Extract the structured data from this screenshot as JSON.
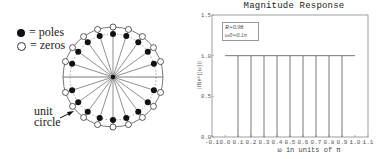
{
  "pole_zero": {
    "legend": [
      {
        "symbol": "filled-dot",
        "label": "=  poles"
      },
      {
        "symbol": "open-circle",
        "label": "=  zeros"
      }
    ],
    "annotation": {
      "line1": "unit",
      "line2": "circle"
    },
    "pole_radius": 0.98,
    "pole_angles_pi": [
      0.1,
      0.2,
      0.3,
      0.4,
      0.5,
      0.6,
      0.7,
      0.8,
      0.9,
      -0.1,
      -0.2,
      -0.3,
      -0.4,
      -0.5,
      -0.6,
      -0.7,
      -0.8,
      -0.9
    ],
    "zero_angles_pi": [
      0.1,
      0.2,
      0.3,
      0.4,
      0.5,
      0.6,
      0.7,
      0.8,
      0.9,
      -0.1,
      -0.2,
      -0.3,
      -0.4,
      -0.5,
      -0.6,
      -0.7,
      -0.8,
      -0.9
    ]
  },
  "chart_data": {
    "type": "line",
    "title": "Magnitude Response",
    "xlabel": "ω in units of π",
    "ylabel": "|H(e^{jω})|",
    "xlim": [
      -0.1,
      1.1
    ],
    "ylim": [
      0,
      1.5
    ],
    "xticks": [
      "-0.1",
      "0.0",
      "0.1",
      "0.2",
      "0.3",
      "0.4",
      "0.5",
      "0.6",
      "0.7",
      "0.8",
      "0.9",
      "1.0",
      "1.1"
    ],
    "yticks": [
      "0.0",
      "0.5",
      "1.0",
      "1.5"
    ],
    "legend_box": {
      "line1": "R=0.98",
      "line2": "ω0=0.1π"
    },
    "series": [
      {
        "name": "magnitude",
        "x": [
          0.0,
          1.0
        ],
        "y": [
          1.0,
          1.0
        ]
      },
      {
        "name": "notches",
        "x": [
          0.1,
          0.2,
          0.3,
          0.4,
          0.5,
          0.6,
          0.7,
          0.8,
          0.9
        ],
        "y": [
          0,
          0,
          0,
          0,
          0,
          0,
          0,
          0,
          0
        ]
      }
    ],
    "grid": false
  }
}
